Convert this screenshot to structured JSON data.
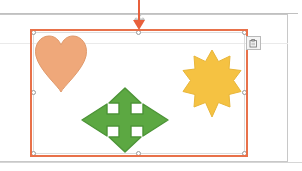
{
  "app": {
    "context": "slide-editor-canvas",
    "background_color": "#ffffff"
  },
  "page": {
    "name": "slide-page",
    "frame_color": "#c8c8c8",
    "guide_color": "#eaeaea"
  },
  "selection": {
    "name": "shape-group-selection",
    "outer_border_color": "#E8714A",
    "inner_border_color": "#dcdcdc",
    "handle_fill": "#ffffff",
    "handle_border": "#9a9a9a",
    "handle_count": 8,
    "handles": [
      "top-left",
      "top-center",
      "top-right",
      "middle-left",
      "middle-right",
      "bottom-left",
      "bottom-center",
      "bottom-right"
    ]
  },
  "drop_indicator": {
    "name": "drag-drop-insertion-marker",
    "color": "#E8603C",
    "direction": "down",
    "x": 138
  },
  "options_button": {
    "name": "paste-options-button",
    "icon": "clipboard-paste-icon",
    "border_color": "#b9b9b9",
    "fill_color": "#f4f4f4"
  },
  "shapes": [
    {
      "id": "heart",
      "name": "heart-shape",
      "icon": "heart-icon",
      "fill": "#EFA87A",
      "stroke": "#E09A6C",
      "position": "top-left"
    },
    {
      "id": "star",
      "name": "star-shape",
      "icon": "star-12-point-icon",
      "fill": "#F5C242",
      "stroke": "#E8B63A",
      "points": 12,
      "position": "top-right"
    },
    {
      "id": "arrow",
      "name": "four-way-arrow-shape",
      "icon": "move-arrow-icon",
      "fill": "#5CA842",
      "stroke": "#4C9437",
      "position": "bottom-center"
    }
  ]
}
